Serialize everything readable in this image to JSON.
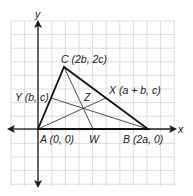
{
  "diagram": {
    "type": "coordinate-geometry",
    "axes": {
      "x_label": "x",
      "y_label": "y"
    },
    "points": {
      "A": {
        "name": "A",
        "label": "A (0, 0)",
        "coords": "(0, 0)"
      },
      "B": {
        "name": "B",
        "label": "B (2a, 0)",
        "coords": "(2a, 0)"
      },
      "C": {
        "name": "C",
        "label": "C (2b, 2c)",
        "coords": "(2b, 2c)"
      },
      "X": {
        "name": "X",
        "label": "X (a + b, c)",
        "coords": "(a + b, c)"
      },
      "Y": {
        "name": "Y",
        "label": "Y (b, c)",
        "coords": "(b, c)"
      },
      "W": {
        "name": "W",
        "label": "W"
      },
      "Z": {
        "name": "Z",
        "label": "Z"
      }
    },
    "segments": [
      {
        "from": "A",
        "to": "B",
        "kind": "side"
      },
      {
        "from": "B",
        "to": "C",
        "kind": "side"
      },
      {
        "from": "C",
        "to": "A",
        "kind": "side"
      },
      {
        "from": "A",
        "to": "X",
        "kind": "median"
      },
      {
        "from": "B",
        "to": "Y",
        "kind": "median"
      },
      {
        "from": "C",
        "to": "W",
        "kind": "median"
      }
    ]
  }
}
